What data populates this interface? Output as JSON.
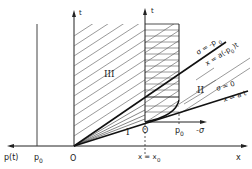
{
  "diagram": {
    "axes": {
      "main_x_label": "x",
      "main_left_label": "p(t)",
      "main_t_label": "t",
      "inner_t_label": "t",
      "inner_sigma_label": "-σ"
    },
    "ticks": {
      "origin": "O",
      "p0_main": "p",
      "p0_main_sub": "0",
      "origin_inner": "O",
      "p0_inner": "p",
      "p0_inner_sub": "0",
      "x_eq_x0": "x = x",
      "x_eq_x0_sub": "0"
    },
    "regions": {
      "I": "I",
      "II": "II",
      "III": "III"
    },
    "lines": {
      "upper_sigma": "σ = -p",
      "upper_sigma_sub": "0",
      "upper_eq": "x = a(-p",
      "upper_eq_sub": "0",
      "upper_eq_tail": ")t",
      "lower_sigma": "σ = 0",
      "lower_eq": "x = a t",
      "lower_eq_bar": "‾"
    },
    "colors": {
      "ink": "#222222",
      "hatch": "#555555",
      "background": "#ffffff"
    }
  }
}
